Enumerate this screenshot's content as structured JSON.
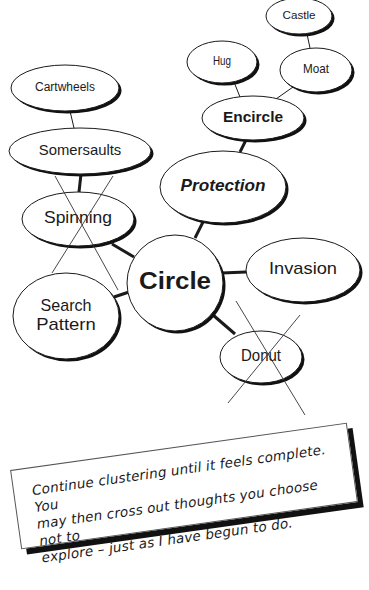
{
  "diagram": {
    "type": "cluster-map",
    "center": {
      "id": "circle",
      "label": "Circle",
      "cx": 175,
      "cy": 283,
      "rx": 48,
      "ry": 48,
      "style": "bold",
      "font_size": 24
    },
    "nodes": [
      {
        "id": "castle",
        "label": "Castle",
        "cx": 299,
        "cy": 16,
        "rx": 33,
        "ry": 18,
        "style": "normal",
        "font_size": 11,
        "crossed": false
      },
      {
        "id": "hug",
        "label": "Hug",
        "cx": 222,
        "cy": 62,
        "rx": 35,
        "ry": 21,
        "style": "normal",
        "font_size": 12,
        "crossed": false
      },
      {
        "id": "moat",
        "label": "Moat",
        "cx": 316,
        "cy": 70,
        "rx": 36,
        "ry": 22,
        "style": "normal",
        "font_size": 13,
        "crossed": false
      },
      {
        "id": "encircle",
        "label": "Encircle",
        "cx": 253,
        "cy": 118,
        "rx": 51,
        "ry": 22,
        "style": "bold",
        "font_size": 15,
        "crossed": false
      },
      {
        "id": "cartwheels",
        "label": "Cartwheels",
        "cx": 65,
        "cy": 88,
        "rx": 54,
        "ry": 23,
        "style": "normal",
        "font_size": 12,
        "crossed": false
      },
      {
        "id": "somersaults",
        "label": "Somersaults",
        "cx": 80,
        "cy": 151,
        "rx": 71,
        "ry": 23,
        "style": "normal",
        "font_size": 15,
        "crossed": false
      },
      {
        "id": "protection",
        "label": "Protection",
        "cx": 223,
        "cy": 187,
        "rx": 63,
        "ry": 36,
        "style": "bold-italic",
        "font_size": 17,
        "crossed": false
      },
      {
        "id": "spinning",
        "label": "Spinning",
        "cx": 78,
        "cy": 219,
        "rx": 56,
        "ry": 27,
        "style": "normal",
        "font_size": 17,
        "crossed": true
      },
      {
        "id": "invasion",
        "label": "Invasion",
        "cx": 303,
        "cy": 270,
        "rx": 57,
        "ry": 32,
        "style": "normal",
        "font_size": 17,
        "crossed": false
      },
      {
        "id": "search",
        "label": "Search Pattern",
        "lines": [
          "Search",
          "Pattern"
        ],
        "cx": 66,
        "cy": 316,
        "rx": 53,
        "ry": 43,
        "style": "normal",
        "font_size": 17,
        "crossed": false
      },
      {
        "id": "donut",
        "label": "Donut",
        "cx": 261,
        "cy": 357,
        "rx": 41,
        "ry": 26,
        "style": "normal",
        "font_size": 16,
        "crossed": true
      }
    ],
    "edges": [
      {
        "from": "castle",
        "to": "moat",
        "x1": 307,
        "y1": 34,
        "x2": 310,
        "y2": 48,
        "weight": "thin"
      },
      {
        "from": "hug",
        "to": "encircle",
        "x1": 234,
        "y1": 82,
        "x2": 240,
        "y2": 97,
        "weight": "thin"
      },
      {
        "from": "moat",
        "to": "encircle",
        "x1": 293,
        "y1": 87,
        "x2": 276,
        "y2": 99,
        "weight": "thin"
      },
      {
        "from": "encircle",
        "to": "protection",
        "x1": 246,
        "y1": 140,
        "x2": 240,
        "y2": 152,
        "weight": "thick"
      },
      {
        "from": "cartwheels",
        "to": "somersaults",
        "x1": 70,
        "y1": 111,
        "x2": 74,
        "y2": 128,
        "weight": "thin"
      },
      {
        "from": "somersaults",
        "to": "spinning",
        "x1": 81,
        "y1": 174,
        "x2": 79,
        "y2": 192,
        "weight": "thick"
      },
      {
        "from": "protection",
        "to": "circle",
        "x1": 203,
        "y1": 222,
        "x2": 195,
        "y2": 238,
        "weight": "thick"
      },
      {
        "from": "spinning",
        "to": "circle",
        "x1": 112,
        "y1": 244,
        "x2": 134,
        "y2": 257,
        "weight": "thick"
      },
      {
        "from": "invasion",
        "to": "circle",
        "x1": 246,
        "y1": 272,
        "x2": 222,
        "y2": 273,
        "weight": "thick"
      },
      {
        "from": "search",
        "to": "circle",
        "x1": 114,
        "y1": 297,
        "x2": 129,
        "y2": 292,
        "weight": "thick"
      },
      {
        "from": "circle",
        "to": "donut",
        "x1": 213,
        "y1": 315,
        "x2": 235,
        "y2": 334,
        "weight": "thick"
      }
    ],
    "cross_marks": [
      {
        "node": "spinning",
        "lines": [
          [
            55,
            176,
            118,
            290
          ],
          [
            113,
            176,
            52,
            273
          ]
        ]
      },
      {
        "node": "donut",
        "lines": [
          [
            236,
            301,
            305,
            415
          ],
          [
            300,
            315,
            228,
            403
          ]
        ]
      }
    ]
  },
  "note": {
    "text": "Continue clustering until it feels complete. You may then cross out thoughts you choose not to explore – just as I have begun to do.",
    "lines": [
      "Continue clustering until it feels complete. You",
      "may then cross out thoughts you choose not to",
      "explore – just as I have begun to do."
    ]
  },
  "colors": {
    "ink": "#1a1a1a",
    "paper": "#ffffff",
    "shadow": "#111111"
  }
}
